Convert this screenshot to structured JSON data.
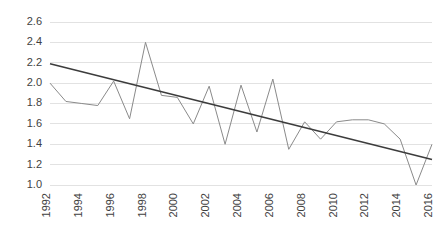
{
  "chart_data": {
    "type": "line",
    "title": "",
    "subtitle": "",
    "xlabel": "",
    "ylabel": "",
    "xlim": [
      1992,
      2016
    ],
    "ylim": [
      1.0,
      2.6
    ],
    "grid": true,
    "grid_axis": "y",
    "legend": "none",
    "x": [
      1992,
      1993,
      1994,
      1995,
      1996,
      1997,
      1998,
      1999,
      2000,
      2001,
      2002,
      2003,
      2004,
      2005,
      2006,
      2007,
      2008,
      2009,
      2010,
      2011,
      2012,
      2013,
      2014,
      2015,
      2016
    ],
    "series": [
      {
        "name": "data",
        "color": "#8a8a8a",
        "style": "solid",
        "values": [
          2.0,
          1.82,
          1.8,
          1.78,
          2.02,
          1.65,
          2.4,
          1.88,
          1.86,
          1.6,
          1.97,
          1.4,
          1.98,
          1.52,
          2.04,
          1.35,
          1.62,
          1.45,
          1.62,
          1.64,
          1.64,
          1.6,
          1.45,
          1.0,
          1.4
        ]
      },
      {
        "name": "linear-trendline",
        "color": "#3c3c3c",
        "style": "solid",
        "start": {
          "x": 1992,
          "y": 2.19
        },
        "end": {
          "x": 2016,
          "y": 1.25
        }
      }
    ],
    "yticks": [
      "1.0",
      "1.2",
      "1.4",
      "1.6",
      "1.8",
      "2.0",
      "2.2",
      "2.4",
      "2.6"
    ],
    "ytick_values": [
      1.0,
      1.2,
      1.4,
      1.6,
      1.8,
      2.0,
      2.2,
      2.4,
      2.6
    ],
    "xticks": [
      "1992",
      "1994",
      "1996",
      "1998",
      "2000",
      "2002",
      "2004",
      "2006",
      "2008",
      "2010",
      "2012",
      "2014",
      "2016"
    ],
    "xtick_values": [
      1992,
      1994,
      1996,
      1998,
      2000,
      2002,
      2004,
      2006,
      2008,
      2010,
      2012,
      2014,
      2016
    ],
    "xtick_rotation": -90,
    "colors": {
      "series": "#8a8a8a",
      "trendline": "#3c3c3c",
      "grid": "#e2e2e2",
      "tick_text": "#3f3f3f",
      "background": "#ffffff"
    },
    "plot_area": {
      "left": 50,
      "right": 432,
      "top": 22,
      "bottom": 185
    }
  }
}
